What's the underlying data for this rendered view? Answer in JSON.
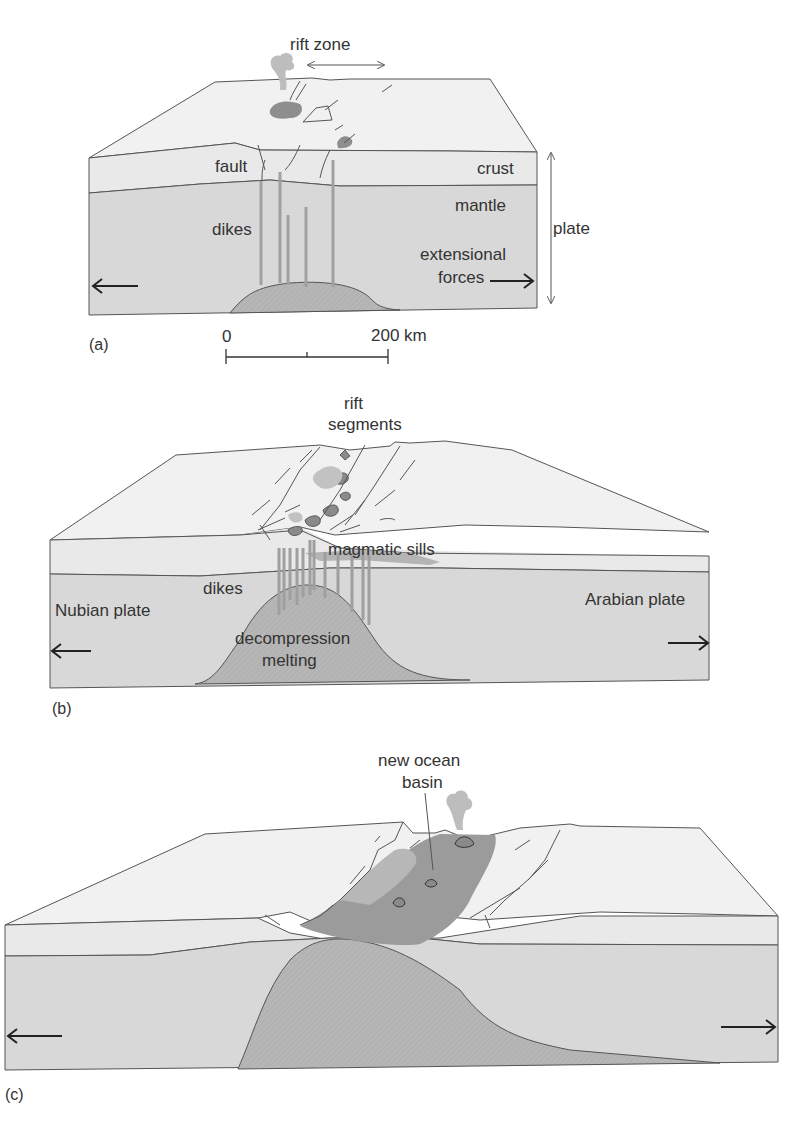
{
  "colors": {
    "top_surface": "#f1f1f1",
    "crust": "#e8e8e8",
    "mantle": "#d6d6d6",
    "melt": "#b4b4b4",
    "dike": "#a8a8a8",
    "lava": "#8e8e8e",
    "plume": "#bdbdbd",
    "text": "#333333",
    "line": "#555555"
  },
  "panels": [
    {
      "id": "a",
      "panel_label": "(a)",
      "labels": {
        "rift_zone": "rift zone",
        "fault": "fault",
        "crust": "crust",
        "mantle": "mantle",
        "dikes": "dikes",
        "plate": "plate",
        "extensional_forces_line1": "extensional",
        "extensional_forces_line2": "forces"
      },
      "scale_bar": {
        "start_label": "0",
        "end_label": "200 km"
      }
    },
    {
      "id": "b",
      "panel_label": "(b)",
      "labels": {
        "rift_segments_line1": "rift",
        "rift_segments_line2": "segments",
        "magmatic_sills": "magmatic sills",
        "dikes": "dikes",
        "nubian_plate": "Nubian plate",
        "arabian_plate": "Arabian plate",
        "decompression_melting_line1": "decompression",
        "decompression_melting_line2": "melting"
      }
    },
    {
      "id": "c",
      "panel_label": "(c)",
      "labels": {
        "new_ocean_basin_line1": "new ocean",
        "new_ocean_basin_line2": "basin"
      }
    }
  ]
}
